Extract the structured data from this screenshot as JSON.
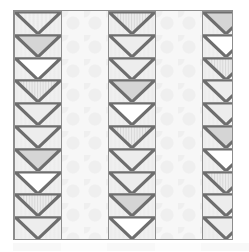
{
  "figure": {
    "title": "",
    "frame": {
      "border_color": "#8d8d8d",
      "background_color": "#fbfbfb",
      "x": 13,
      "y": 10,
      "width": 220,
      "height": 230
    },
    "layout": {
      "band_order": [
        "tiles",
        "gap",
        "tiles",
        "gap",
        "tiles"
      ],
      "band_widths": [
        48,
        46,
        48,
        46,
        48
      ],
      "rows_per_tile_column": 10,
      "cell_motif": "inverted-triangle-chevron"
    },
    "palette": {
      "line": "#6e6e6e",
      "cell_background": "#f0f0f0",
      "gap_background": "#f7f7f7",
      "gap_dot": "#efefef",
      "fill_light": "#ededed",
      "fill_gray": "#d5d5d5",
      "fill_white": "#ffffff",
      "fill_stripe_base": "#ececec",
      "fill_stripe_line": "#d8d8d8",
      "fill_dotted_base": "#f1f1f1",
      "fill_dotted_dot": "#e3e3e3"
    },
    "fill_legend": [
      {
        "key": "dotted",
        "label": "dotted"
      },
      {
        "key": "gray",
        "label": "solid gray"
      },
      {
        "key": "white",
        "label": "white"
      },
      {
        "key": "stripe",
        "label": "vertical stripes"
      },
      {
        "key": "light",
        "label": "plain light"
      }
    ],
    "columns": [
      {
        "name": "left-tile-column",
        "cells": [
          {
            "fill": "dotted"
          },
          {
            "fill": "gray"
          },
          {
            "fill": "white"
          },
          {
            "fill": "stripe"
          },
          {
            "fill": "light"
          },
          {
            "fill": "light"
          },
          {
            "fill": "gray"
          },
          {
            "fill": "white"
          },
          {
            "fill": "stripe"
          },
          {
            "fill": "light"
          }
        ]
      },
      {
        "name": "middle-tile-column",
        "cells": [
          {
            "fill": "stripe"
          },
          {
            "fill": "light"
          },
          {
            "fill": "light"
          },
          {
            "fill": "gray"
          },
          {
            "fill": "white"
          },
          {
            "fill": "stripe"
          },
          {
            "fill": "light"
          },
          {
            "fill": "light"
          },
          {
            "fill": "gray"
          },
          {
            "fill": "white"
          }
        ]
      },
      {
        "name": "right-tile-column",
        "cells": [
          {
            "fill": "gray"
          },
          {
            "fill": "white"
          },
          {
            "fill": "stripe"
          },
          {
            "fill": "light"
          },
          {
            "fill": "light"
          },
          {
            "fill": "gray"
          },
          {
            "fill": "white"
          },
          {
            "fill": "stripe"
          },
          {
            "fill": "light"
          },
          {
            "fill": "light"
          }
        ]
      }
    ],
    "gaps": [
      {
        "name": "left-gap-column",
        "pattern": "polka-dots"
      },
      {
        "name": "right-gap-column",
        "pattern": "polka-dots"
      }
    ],
    "undertone": {
      "visible": true,
      "segments": [
        "a",
        "b",
        "a",
        "b",
        "a"
      ]
    }
  }
}
